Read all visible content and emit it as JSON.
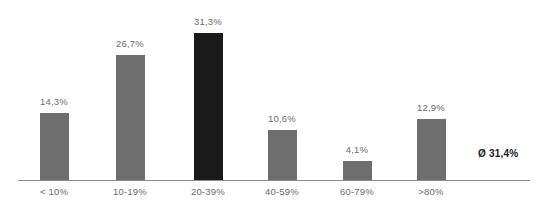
{
  "chart_data": {
    "type": "bar",
    "title": "",
    "subtitle": "",
    "xlabel": "",
    "ylabel": "",
    "grid": false,
    "legend": false,
    "ylim": [
      0,
      31.3
    ],
    "categories": [
      "< 10%",
      "10-19%",
      "20-39%",
      "40-59%",
      "60-79%",
      ">80%"
    ],
    "values": [
      14.3,
      26.7,
      31.3,
      10.6,
      4.1,
      12.9
    ],
    "value_labels": [
      "14,3%",
      "26,7%",
      "31,3%",
      "10,6%",
      "4,1%",
      "12,9%"
    ],
    "highlight_index": 2,
    "annotations": [
      {
        "name": "average",
        "text": "Ø 31,4%",
        "value": 31.4
      }
    ],
    "colors": {
      "bar": "#6e6e6e",
      "bar_highlight": "#1a1a1a",
      "axis": "#8c8c8c",
      "label_text": "#6a6a6a",
      "annotation_text": "#1a1a1a",
      "background": "#ffffff"
    }
  }
}
